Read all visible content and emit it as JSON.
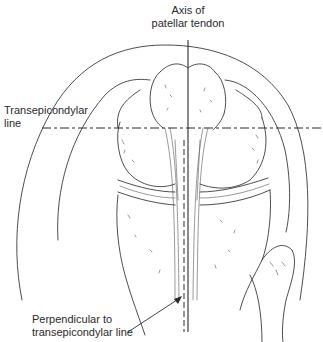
{
  "diagram": {
    "labels": {
      "axis_line1": "Axis of",
      "axis_line2": "patellar tendon",
      "transepicondylar_line1": "Transepicondylar",
      "transepicondylar_line2": "line",
      "perpendicular_line1": "Perpendicular to",
      "perpendicular_line2": "transepicondylar line"
    },
    "colors": {
      "line": "#2a2a2a",
      "background": "#ffffff"
    }
  }
}
